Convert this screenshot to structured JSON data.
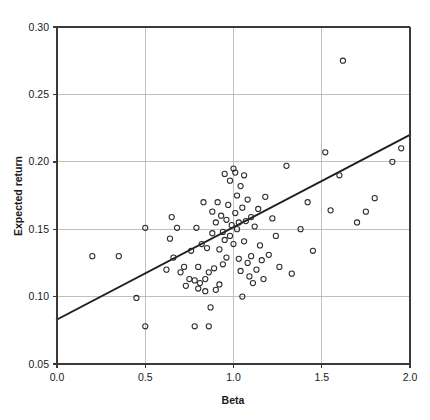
{
  "chart_data": {
    "type": "scatter",
    "title": "",
    "xlabel": "Beta",
    "ylabel": "Expected return",
    "xlim": [
      0.0,
      2.0
    ],
    "ylim": [
      0.05,
      0.3
    ],
    "xticks": [
      0.0,
      0.5,
      1.0,
      1.5,
      2.0
    ],
    "xtick_labels": [
      "0.0",
      "0.5",
      "1.0",
      "1.5",
      "2.0"
    ],
    "yticks": [
      0.05,
      0.1,
      0.15,
      0.2,
      0.25,
      0.3
    ],
    "ytick_labels": [
      "0.05",
      "0.10",
      "0.15",
      "0.20",
      "0.25",
      "0.30"
    ],
    "grid": true,
    "grid_color": "#b9b9b9",
    "legend": null,
    "marker_style": "open-circle",
    "marker_color": "#2b2b2b",
    "marker_radius_px": 2.6,
    "series": [
      {
        "name": "Securities",
        "x": [
          0.2,
          0.35,
          0.45,
          0.5,
          0.5,
          0.62,
          0.64,
          0.65,
          0.66,
          0.68,
          0.7,
          0.72,
          0.73,
          0.75,
          0.76,
          0.78,
          0.78,
          0.79,
          0.8,
          0.8,
          0.81,
          0.82,
          0.83,
          0.84,
          0.84,
          0.85,
          0.86,
          0.86,
          0.87,
          0.88,
          0.88,
          0.89,
          0.9,
          0.9,
          0.91,
          0.92,
          0.92,
          0.93,
          0.94,
          0.94,
          0.95,
          0.95,
          0.96,
          0.96,
          0.97,
          0.98,
          0.98,
          0.99,
          1.0,
          1.0,
          1.01,
          1.01,
          1.02,
          1.02,
          1.03,
          1.03,
          1.04,
          1.04,
          1.05,
          1.05,
          1.06,
          1.06,
          1.07,
          1.08,
          1.08,
          1.09,
          1.1,
          1.1,
          1.11,
          1.12,
          1.13,
          1.14,
          1.15,
          1.16,
          1.17,
          1.18,
          1.2,
          1.22,
          1.24,
          1.26,
          1.3,
          1.33,
          1.38,
          1.42,
          1.45,
          1.52,
          1.55,
          1.6,
          1.62,
          1.7,
          1.75,
          1.8,
          1.9,
          1.95
        ],
        "y": [
          0.13,
          0.13,
          0.099,
          0.151,
          0.078,
          0.12,
          0.143,
          0.159,
          0.129,
          0.151,
          0.118,
          0.122,
          0.108,
          0.113,
          0.134,
          0.112,
          0.078,
          0.151,
          0.106,
          0.122,
          0.11,
          0.139,
          0.17,
          0.113,
          0.104,
          0.136,
          0.078,
          0.118,
          0.092,
          0.163,
          0.147,
          0.121,
          0.155,
          0.105,
          0.17,
          0.135,
          0.109,
          0.16,
          0.148,
          0.124,
          0.191,
          0.142,
          0.157,
          0.129,
          0.168,
          0.186,
          0.145,
          0.153,
          0.195,
          0.139,
          0.192,
          0.162,
          0.175,
          0.15,
          0.155,
          0.128,
          0.182,
          0.119,
          0.166,
          0.1,
          0.19,
          0.141,
          0.156,
          0.172,
          0.125,
          0.115,
          0.13,
          0.159,
          0.11,
          0.152,
          0.12,
          0.165,
          0.138,
          0.127,
          0.113,
          0.174,
          0.131,
          0.158,
          0.145,
          0.122,
          0.197,
          0.117,
          0.15,
          0.17,
          0.134,
          0.207,
          0.164,
          0.19,
          0.275,
          0.155,
          0.163,
          0.173,
          0.2,
          0.21
        ]
      }
    ],
    "trendline": {
      "name": "Security market line",
      "x_start": 0.0,
      "y_start": 0.083,
      "x_end": 2.0,
      "y_end": 0.22,
      "color": "#1f1f1f"
    }
  }
}
